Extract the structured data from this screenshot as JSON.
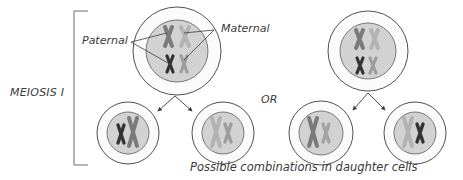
{
  "diagram": {
    "title": "MEIOSIS I",
    "labels": {
      "stage": "MEIOSIS I",
      "paternal": "Paternal",
      "maternal": "Maternal",
      "or": "OR",
      "caption": "Possible combinations in daughter cells"
    },
    "colors": {
      "outline": "#3c3c3c",
      "cytoplasm": "#fbfbfb",
      "nucleus": "#d2d2d2",
      "paternal_dark": "#3a3a3a",
      "paternal_mid": "#7a7a7a",
      "maternal_light": "#a9a9a9",
      "maternal_pale": "#b8b8b8"
    },
    "parent_cells": [
      {
        "id": "parent-left",
        "cx": 177,
        "cy": 51,
        "r_outer": 44,
        "r_inner": 31
      },
      {
        "id": "parent-right",
        "cx": 368,
        "cy": 51,
        "r_outer": 40,
        "r_inner": 28
      }
    ],
    "daughter_cells": [
      {
        "id": "daughter-1",
        "cx": 128,
        "cy": 133,
        "r_outer": 31,
        "r_inner": 21,
        "contents": "paternal"
      },
      {
        "id": "daughter-2",
        "cx": 223,
        "cy": 133,
        "r_outer": 31,
        "r_inner": 21,
        "contents": "maternal"
      },
      {
        "id": "daughter-3",
        "cx": 321,
        "cy": 133,
        "r_outer": 32,
        "r_inner": 22,
        "contents": "mixed-a"
      },
      {
        "id": "daughter-4",
        "cx": 415,
        "cy": 133,
        "r_outer": 31,
        "r_inner": 21,
        "contents": "mixed-b"
      }
    ]
  }
}
